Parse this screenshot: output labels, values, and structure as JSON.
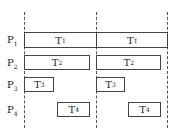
{
  "diagram": {
    "type": "gantt-schedule",
    "dividers_x": [
      24,
      96,
      167
    ],
    "processors": [
      {
        "label": "P",
        "sub": "1",
        "y": 33
      },
      {
        "label": "P",
        "sub": "2",
        "y": 56
      },
      {
        "label": "P",
        "sub": "3",
        "y": 78
      },
      {
        "label": "P",
        "sub": "4",
        "y": 103
      }
    ],
    "tasks": [
      {
        "label": "T",
        "sub": "1",
        "prime": "",
        "row": 1,
        "x": 24,
        "w": 72,
        "y": 32,
        "h": 16
      },
      {
        "label": "T",
        "sub": "1",
        "prime": "′",
        "row": 1,
        "x": 96,
        "w": 72,
        "y": 32,
        "h": 16
      },
      {
        "label": "T",
        "sub": "2",
        "prime": "",
        "row": 2,
        "x": 24,
        "w": 66,
        "y": 55,
        "h": 15
      },
      {
        "label": "T",
        "sub": "2",
        "prime": "′",
        "row": 2,
        "x": 96,
        "w": 65,
        "y": 55,
        "h": 15
      },
      {
        "label": "T",
        "sub": "3",
        "prime": "′",
        "row": 3,
        "x": 24,
        "w": 30,
        "y": 77,
        "h": 15
      },
      {
        "label": "T",
        "sub": "3",
        "prime": "",
        "row": 3,
        "x": 96,
        "w": 29,
        "y": 77,
        "h": 15
      },
      {
        "label": "T",
        "sub": "4",
        "prime": "′",
        "row": 4,
        "x": 57,
        "w": 33,
        "y": 102,
        "h": 15
      },
      {
        "label": "T",
        "sub": "4",
        "prime": "",
        "row": 4,
        "x": 128,
        "w": 33,
        "y": 102,
        "h": 15
      }
    ]
  }
}
